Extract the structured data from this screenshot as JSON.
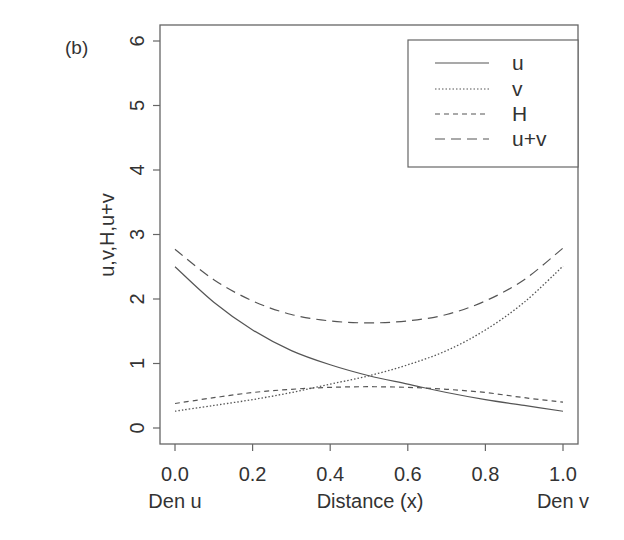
{
  "panel_label": "(b)",
  "chart_data": {
    "type": "line",
    "title": "",
    "panel": "(b)",
    "xlabel": "Distance (x)",
    "ylabel": "u,v,H,u+v",
    "x_end_labels": {
      "left": "Den u",
      "right": "Den v"
    },
    "xlim": [
      0,
      1
    ],
    "ylim": [
      0,
      6
    ],
    "xticks": [
      "0.0",
      "0.2",
      "0.4",
      "0.6",
      "0.8",
      "1.0"
    ],
    "yticks": [
      "0",
      "1",
      "2",
      "3",
      "4",
      "5",
      "6"
    ],
    "grid": false,
    "legend_position": "top-right",
    "x": [
      0.0,
      0.1,
      0.2,
      0.3,
      0.4,
      0.5,
      0.6,
      0.7,
      0.8,
      0.9,
      1.0
    ],
    "series": [
      {
        "name": "u",
        "style": "solid",
        "values": [
          2.5,
          1.95,
          1.52,
          1.2,
          0.98,
          0.81,
          0.68,
          0.55,
          0.44,
          0.35,
          0.26
        ]
      },
      {
        "name": "v",
        "style": "dotted",
        "values": [
          0.26,
          0.35,
          0.44,
          0.55,
          0.68,
          0.81,
          0.98,
          1.2,
          1.52,
          1.95,
          2.51
        ]
      },
      {
        "name": "H",
        "style": "dashed",
        "values": [
          0.38,
          0.47,
          0.55,
          0.6,
          0.63,
          0.64,
          0.63,
          0.6,
          0.55,
          0.47,
          0.4
        ]
      },
      {
        "name": "u+v",
        "style": "longdash",
        "values": [
          2.77,
          2.3,
          1.97,
          1.76,
          1.66,
          1.63,
          1.66,
          1.76,
          1.97,
          2.3,
          2.79
        ]
      }
    ]
  }
}
